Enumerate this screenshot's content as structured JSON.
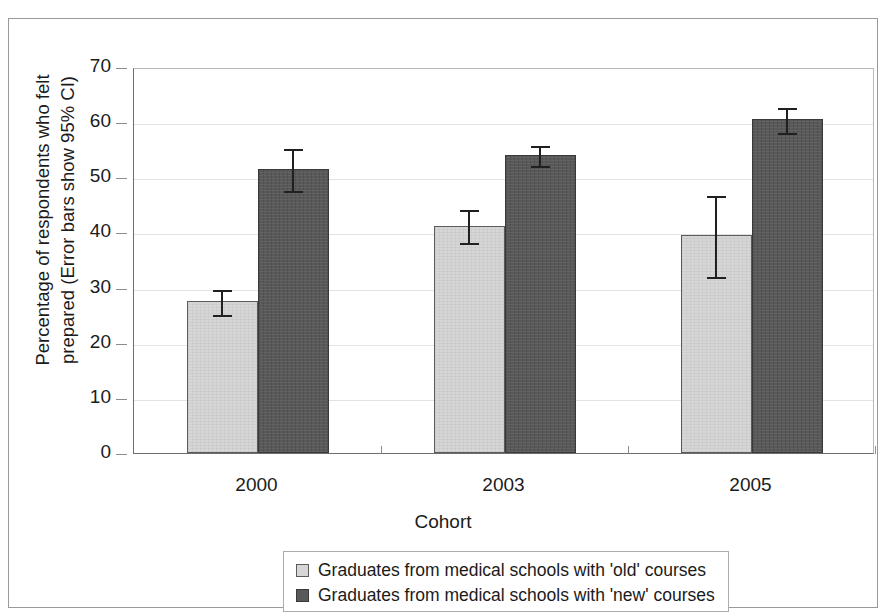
{
  "chart_data": {
    "type": "bar",
    "title": "",
    "subtitle": "",
    "xlabel": "Cohort",
    "ylabel": "Percentage of respondents who felt\nprepared (Error bars show 95% CI)",
    "categories": [
      "2000",
      "2003",
      "2005"
    ],
    "ylim": [
      0,
      70
    ],
    "yticks": [
      0,
      10,
      20,
      30,
      40,
      50,
      60,
      70
    ],
    "ytick_labels": [
      "0",
      "10",
      "20",
      "30",
      "40",
      "50",
      "60",
      "70"
    ],
    "grid": true,
    "legend_position": "bottom",
    "error_bar_type": "95% CI",
    "series": [
      {
        "name": "Graduates from medical schools with 'old' courses",
        "color": "#d6d6d6",
        "values": [
          27.5,
          41.2,
          39.5
        ],
        "error_low": [
          25.0,
          38.0,
          32.0
        ],
        "error_high": [
          30.0,
          44.5,
          47.0
        ]
      },
      {
        "name": "Graduates from medical schools with 'new' courses",
        "color": "#595959",
        "values": [
          51.5,
          54.0,
          60.5
        ],
        "error_low": [
          47.5,
          52.0,
          58.0
        ],
        "error_high": [
          55.5,
          56.0,
          63.0
        ]
      }
    ]
  },
  "legend": {
    "items": [
      {
        "label": "Graduates from medical schools with 'old' courses",
        "swatch": "light"
      },
      {
        "label": "Graduates from medical schools with 'new' courses",
        "swatch": "dark"
      }
    ]
  },
  "colors": {
    "old_courses": "#d6d6d6",
    "new_courses": "#595959",
    "axis": "#6d6d6d",
    "gridline": "#e3e3e3",
    "frame": "#9a9a9a",
    "text": "#1b1b1b",
    "error_bar": "#202020"
  }
}
